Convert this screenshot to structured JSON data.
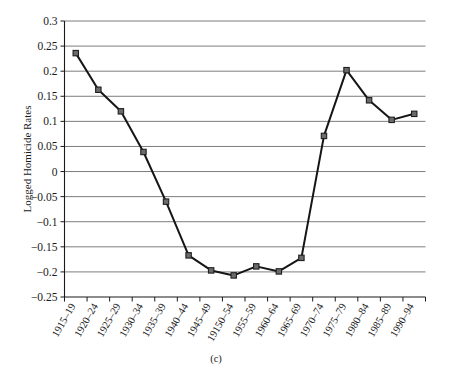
{
  "figure": {
    "caption": "(c)",
    "ylabel": "Logged Homicide Rates"
  },
  "chart_data": {
    "type": "line",
    "title": "",
    "xlabel": "",
    "ylabel": "Logged Homicide Rates",
    "ylim": [
      -0.25,
      0.3
    ],
    "yticks": [
      0.3,
      0.25,
      0.2,
      0.15,
      0.1,
      0.05,
      0,
      -0.05,
      -0.1,
      -0.15,
      -0.2,
      -0.25
    ],
    "ytick_labels": [
      "0.3",
      "0.25",
      "0.2",
      "0.15",
      "0.1",
      "0.05",
      "0",
      "−0.05",
      "−0.1",
      "−0.15",
      "−0.2",
      "−0.25"
    ],
    "grid": true,
    "legend": "none",
    "marker": "square",
    "categories": [
      "1915–19",
      "1920–24",
      "1925–29",
      "1930–34",
      "1935–39",
      "1940–44",
      "1945–49",
      "19150–54",
      "1955–59",
      "1960–64",
      "1965–69",
      "1970–74",
      "1975–79",
      "1980–84",
      "1985–89",
      "1990–94"
    ],
    "values": [
      0.236,
      0.163,
      0.12,
      0.039,
      -0.06,
      -0.167,
      -0.197,
      -0.207,
      -0.189,
      -0.199,
      -0.172,
      0.071,
      0.202,
      0.142,
      0.103,
      0.115
    ],
    "series": [
      {
        "name": "Logged Homicide Rates",
        "values": [
          0.236,
          0.163,
          0.12,
          0.039,
          -0.06,
          -0.167,
          -0.197,
          -0.207,
          -0.189,
          -0.199,
          -0.172,
          0.071,
          0.202,
          0.142,
          0.103,
          0.115
        ]
      }
    ],
    "colors": {
      "line": "#151515",
      "marker_fill": "#6b6b6b",
      "marker_stroke": "#1f1f1f",
      "grid": "#6e6e6e",
      "axis": "#1a1a1a",
      "background": "#ffffff"
    }
  }
}
